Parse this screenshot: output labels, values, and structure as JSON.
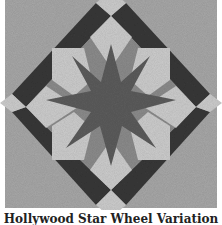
{
  "figure": {
    "caption": "Hollywood Star Wheel Variation",
    "colors": {
      "background": "#a8a8a8",
      "dark_band": "#383838",
      "light_patch": "#cdcdcd",
      "mid_triangle": "#8c8c8c",
      "star": "#5c5c5c",
      "page": "#ffffff"
    }
  }
}
